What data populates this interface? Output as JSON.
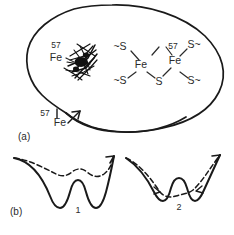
{
  "figure": {
    "panels": [
      {
        "id": "a",
        "label": "(a)",
        "description": "cell-membrane-with-iron-sulfur-cluster",
        "annotations": [
          {
            "name": "isotope-label-cluster",
            "isotope": "57",
            "element": "Fe"
          },
          {
            "name": "isotope-label-membrane",
            "isotope": "57",
            "element": "Fe"
          },
          {
            "name": "isotope-label-ironsulfur",
            "isotope": "57"
          }
        ],
        "cluster_scribble": "dark-iron-cluster-scribble",
        "iron_sulfur": {
          "name": "iron-sulfur-cluster-formula",
          "top_row": [
            "~S",
            "S~"
          ],
          "metals": [
            "Fe",
            "Fe"
          ],
          "bottom_row": [
            "~S",
            "S",
            "S~"
          ],
          "isotope_marker": "57"
        }
      },
      {
        "id": "b",
        "label": "(b)",
        "description": "potential-energy-double-well-diagrams",
        "wells": [
          {
            "name": "potential-well-1",
            "label": "1",
            "solid": "deep-double-well",
            "dashed": "shallow-double-well"
          },
          {
            "name": "potential-well-2",
            "label": "2",
            "solid": "shallow-double-well",
            "dashed": "broad-single-well"
          }
        ]
      }
    ]
  },
  "colors": {
    "ink": "#1a1a1a",
    "label_ink": "#2b2b2b",
    "background": "#ffffff"
  }
}
